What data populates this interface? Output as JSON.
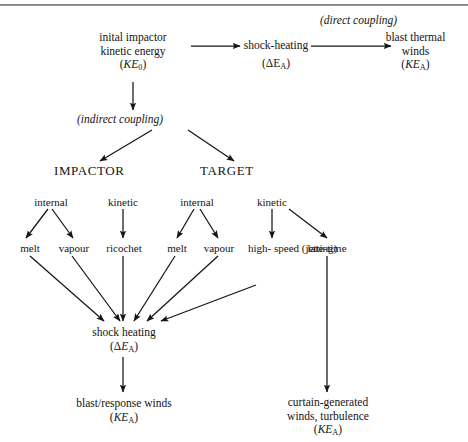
{
  "figure": {
    "width": 468,
    "height": 442,
    "background": "#ffffff",
    "rule_color": "#6f6f6f",
    "line_color": "#151515",
    "text_color": "#141414"
  },
  "captions": {
    "direct_coupling": "(direct coupling)",
    "indirect_coupling": "(indirect coupling)"
  },
  "nodes": {
    "initial_impactor": {
      "line1": "inital impactor",
      "line2": "kinetic energy",
      "symbol_open": "(",
      "symbol": "KE",
      "symbol_sub": "0",
      "symbol_close": ")"
    },
    "shock_heating_top": {
      "line1": "shock-heating",
      "symbol_open": "(ΔE",
      "symbol_sub": "A",
      "symbol_close": ")"
    },
    "blast_thermal_winds": {
      "line1": "blast thermal",
      "line2": "winds",
      "symbol_open": "(",
      "symbol": "KE",
      "symbol_sub": "A",
      "symbol_close": ")"
    },
    "impactor": {
      "label": "IMPACTOR"
    },
    "target": {
      "label": "TARGET"
    },
    "impactor_internal": {
      "label": "internal"
    },
    "impactor_kinetic": {
      "label": "kinetic"
    },
    "target_internal": {
      "label": "internal"
    },
    "target_kinetic": {
      "label": "kinetic"
    },
    "impactor_melt": {
      "label": "melt"
    },
    "impactor_vapour": {
      "label": "vapour"
    },
    "ricochet": {
      "label": "ricochet"
    },
    "target_melt": {
      "label": "melt"
    },
    "target_vapour": {
      "label": "vapour"
    },
    "high_speed_jetting": {
      "line1": "high-",
      "line2": "speed",
      "line3": "(jetting)"
    },
    "late_time": {
      "label": "late-time"
    },
    "shock_heating_mid": {
      "line1": "shock heating",
      "symbol_open": "(Δ",
      "symbol": "E",
      "symbol_sub": "A",
      "symbol_close": ")"
    },
    "blast_response_winds": {
      "line1": "blast/response winds",
      "symbol_open": "(",
      "symbol": "KE",
      "symbol_sub": "A",
      "symbol_close": ")"
    },
    "curtain_generated": {
      "line1": "curtain-generated",
      "line2": "winds, turbulence",
      "symbol_open": "(",
      "symbol": "KE",
      "symbol_sub": "A",
      "symbol_close": ")"
    }
  },
  "edges": [
    {
      "from": "initial_impactor",
      "to": "shock_heating_top",
      "style": "horizontal-arrow"
    },
    {
      "from": "shock_heating_top",
      "to": "blast_thermal_winds",
      "style": "horizontal-arrow"
    },
    {
      "from": "initial_impactor",
      "to": "indirect_coupling",
      "style": "vertical-arrow"
    },
    {
      "from": "indirect_coupling",
      "to": "impactor",
      "style": "diagonal-arrow"
    },
    {
      "from": "indirect_coupling",
      "to": "target",
      "style": "diagonal-arrow"
    },
    {
      "from": "impactor_internal",
      "to": "impactor_melt",
      "style": "diagonal-arrow"
    },
    {
      "from": "impactor_internal",
      "to": "impactor_vapour",
      "style": "diagonal-arrow"
    },
    {
      "from": "impactor_kinetic",
      "to": "ricochet",
      "style": "vertical-arrow"
    },
    {
      "from": "target_internal",
      "to": "target_melt",
      "style": "diagonal-arrow"
    },
    {
      "from": "target_internal",
      "to": "target_vapour",
      "style": "diagonal-arrow"
    },
    {
      "from": "target_kinetic",
      "to": "high_speed_jetting",
      "style": "vertical-arrow"
    },
    {
      "from": "target_kinetic",
      "to": "late_time",
      "style": "diagonal-arrow"
    },
    {
      "from": "impactor_melt",
      "to": "shock_heating_mid",
      "style": "diagonal-arrow"
    },
    {
      "from": "impactor_vapour",
      "to": "shock_heating_mid",
      "style": "diagonal-arrow"
    },
    {
      "from": "ricochet",
      "to": "shock_heating_mid",
      "style": "vertical-arrow"
    },
    {
      "from": "target_melt",
      "to": "shock_heating_mid",
      "style": "diagonal-arrow"
    },
    {
      "from": "target_vapour",
      "to": "shock_heating_mid",
      "style": "diagonal-arrow"
    },
    {
      "from": "high_speed_jetting",
      "to": "shock_heating_mid",
      "style": "diagonal-arrow"
    },
    {
      "from": "shock_heating_mid",
      "to": "blast_response_winds",
      "style": "vertical-arrow"
    },
    {
      "from": "late_time",
      "to": "curtain_generated",
      "style": "vertical-arrow"
    }
  ]
}
